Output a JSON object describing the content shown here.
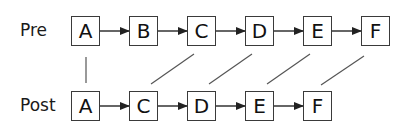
{
  "rows": {
    "pre": {
      "label": "Pre",
      "nodes": [
        "A",
        "B",
        "C",
        "D",
        "E",
        "F"
      ]
    },
    "post": {
      "label": "Post",
      "nodes": [
        "A",
        "C",
        "D",
        "E",
        "F"
      ]
    }
  },
  "mappings": [
    {
      "pre": "A",
      "post": "A"
    },
    {
      "pre": "C",
      "post": "C"
    },
    {
      "pre": "D",
      "post": "D"
    },
    {
      "pre": "E",
      "post": "E"
    },
    {
      "pre": "F",
      "post": "F"
    }
  ],
  "colors": {
    "stroke": "#3a3a3a",
    "text": "#111111",
    "mapping_line": "#555555"
  }
}
